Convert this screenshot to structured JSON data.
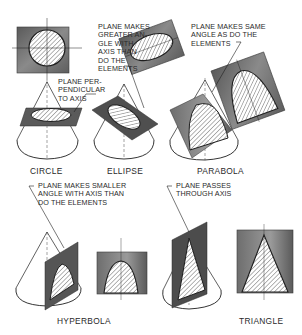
{
  "figure": {
    "colors": {
      "plane_dark": "#4a4a4a",
      "plane_mid": "#7a7a7a",
      "plane_light": "#a8a8a8",
      "hatch": "#555555",
      "line": "#1e1e1e",
      "background": "#ffffff"
    }
  },
  "callouts": {
    "perpendicular": "PLANE PER-\nPENDICULAR\nTO AXIS",
    "greater_angle": "PLANE MAKES\nGREATER AN-\nGLE WITH\nAXIS THAN\nDO THE\nELEMENTS",
    "same_angle": "PLANE MAKES SAME\nANGLE AS DO THE\nELEMENTS",
    "smaller_angle": "PLANE MAKES SMALLER\nANGLE WITH AXIS THAN\nDO THE ELEMENTS",
    "through_axis": "PLANE PASSES\nTHROUGH AXIS"
  },
  "captions": {
    "circle": "CIRCLE",
    "ellipse": "ELLIPSE",
    "parabola": "PARABOLA",
    "hyperbola": "HYPERBOLA",
    "triangle": "TRIANGLE"
  }
}
